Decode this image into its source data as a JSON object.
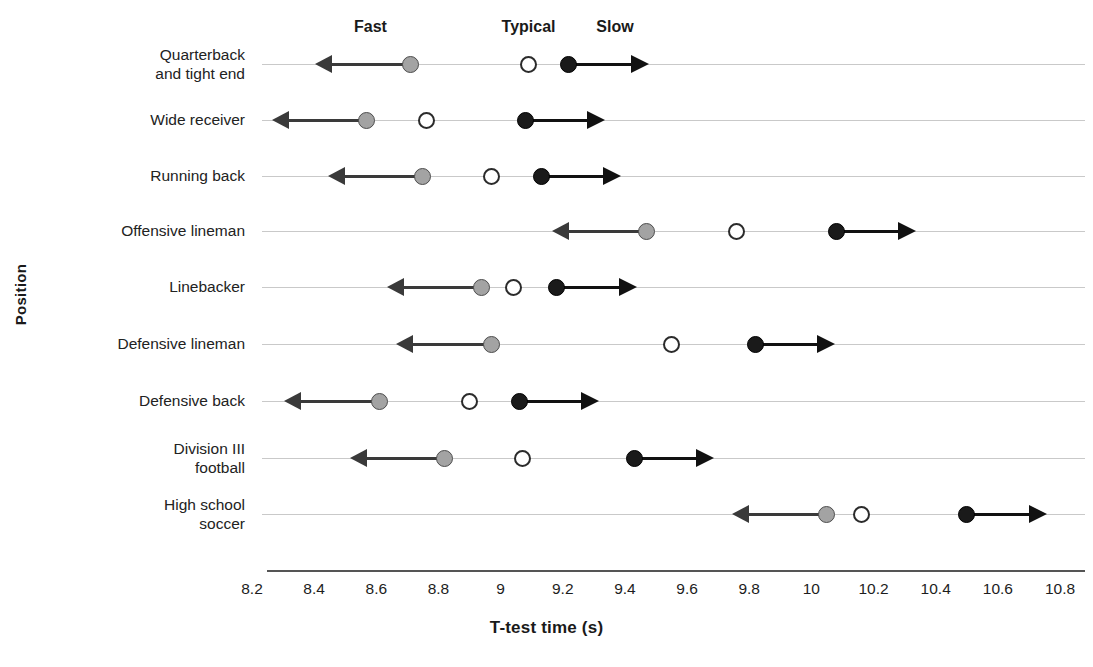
{
  "chart_data": {
    "type": "scatter",
    "title": "",
    "xlabel": "T-test time (s)",
    "ylabel": "Position",
    "xlim": [
      8.2,
      10.8
    ],
    "xticks": [
      "8.2",
      "8.4",
      "8.6",
      "8.8",
      "9",
      "9.2",
      "9.4",
      "9.6",
      "9.8",
      "10",
      "10.2",
      "10.4",
      "10.6",
      "10.8"
    ],
    "xtick_values": [
      8.2,
      8.4,
      8.6,
      8.8,
      9.0,
      9.2,
      9.4,
      9.6,
      9.8,
      10.0,
      10.2,
      10.4,
      10.6,
      10.8
    ],
    "grid": true,
    "legend_position": "top",
    "series": [
      {
        "name": "Fast",
        "marker": "filled-gray-circle",
        "color": "#a3a3a3"
      },
      {
        "name": "Typical",
        "marker": "open-circle",
        "color": "#ffffff"
      },
      {
        "name": "Slow",
        "marker": "filled-black-circle",
        "color": "#1a1a1a"
      }
    ],
    "categories": [
      "Quarterback and tight end",
      "Wide receiver",
      "Running back",
      "Offensive lineman",
      "Linebacker",
      "Defensive lineman",
      "Defensive back",
      "Division III football",
      "High school soccer"
    ],
    "rows": [
      {
        "label": "Quarterback\nand tight end",
        "fast": 8.71,
        "typical": 9.09,
        "slow": 9.22
      },
      {
        "label": "Wide receiver",
        "fast": 8.57,
        "typical": 8.76,
        "slow": 9.08
      },
      {
        "label": "Running back",
        "fast": 8.75,
        "typical": 8.97,
        "slow": 9.13
      },
      {
        "label": "Offensive lineman",
        "fast": 9.47,
        "typical": 9.76,
        "slow": 10.08
      },
      {
        "label": "Linebacker",
        "fast": 8.94,
        "typical": 9.04,
        "slow": 9.18
      },
      {
        "label": "Defensive lineman",
        "fast": 8.97,
        "typical": 9.55,
        "slow": 9.82
      },
      {
        "label": "Defensive back",
        "fast": 8.61,
        "typical": 8.9,
        "slow": 9.06
      },
      {
        "label": "Division III\nfootball",
        "fast": 8.82,
        "typical": 9.07,
        "slow": 9.43
      },
      {
        "label": "High school\nsoccer",
        "fast": 10.05,
        "typical": 10.16,
        "slow": 10.5
      }
    ],
    "annotations": {
      "fast_header": "Fast",
      "typical_header": "Typical",
      "slow_header": "Slow",
      "fast_arrow_direction": "left",
      "slow_arrow_direction": "right"
    },
    "colors": {
      "fast_marker": "#a3a3a3",
      "typical_marker": "#ffffff",
      "slow_marker": "#1a1a1a",
      "fast_arrow": "#3a3a3a",
      "slow_arrow": "#111111",
      "gridline": "#c9c9c9",
      "axis": "#555555"
    }
  },
  "header": {
    "fast": "Fast",
    "typical": "Typical",
    "slow": "Slow"
  },
  "axes": {
    "x_title": "T-test time (s)",
    "y_title": "Position"
  }
}
